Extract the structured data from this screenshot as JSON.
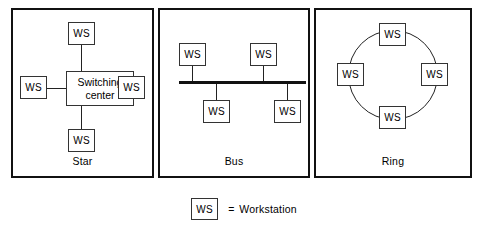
{
  "diagram": {
    "node_label": "WS",
    "colors": {
      "background": "#ffffff",
      "panel_border": "#111111",
      "box_border": "#333333",
      "line": "#222222",
      "text": "#000000"
    }
  },
  "panels": [
    {
      "id": "star",
      "label": "Star",
      "hub": {
        "line1": "Switching",
        "line2": "center"
      },
      "nodes": [
        {
          "position": "top",
          "label": "WS"
        },
        {
          "position": "left",
          "label": "WS"
        },
        {
          "position": "right",
          "label": "WS"
        },
        {
          "position": "bottom",
          "label": "WS"
        }
      ]
    },
    {
      "id": "bus",
      "label": "Bus",
      "nodes": [
        {
          "position": "top-left",
          "label": "WS"
        },
        {
          "position": "top-right",
          "label": "WS"
        },
        {
          "position": "bottom-left",
          "label": "WS"
        },
        {
          "position": "bottom-right",
          "label": "WS"
        }
      ]
    },
    {
      "id": "ring",
      "label": "Ring",
      "nodes": [
        {
          "position": "top",
          "label": "WS"
        },
        {
          "position": "left",
          "label": "WS"
        },
        {
          "position": "right",
          "label": "WS"
        },
        {
          "position": "bottom",
          "label": "WS"
        }
      ]
    }
  ],
  "legend": {
    "symbol": "WS",
    "equals": "=",
    "meaning": "Workstation"
  }
}
